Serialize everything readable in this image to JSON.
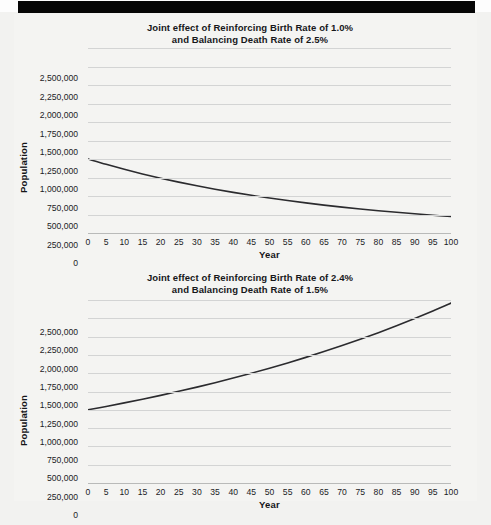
{
  "page": {
    "top_bar_color": "#060606",
    "paper_color": "#f2f2f0",
    "ink_color": "#1b1c1f",
    "grid_color": "#d3d4d4",
    "curve_color": "#2b2b2e"
  },
  "charts": [
    {
      "title_line1": "Joint effect of Reinforcing Birth Rate of 1.0%",
      "title_line2": "and Balancing Death Rate of 2.5%",
      "xlabel": "Year",
      "ylabel": "Population"
    },
    {
      "title_line1": "Joint effect of Reinforcing Birth Rate of 2.4%",
      "title_line2": "and Balancing Death Rate of 1.5%",
      "xlabel": "Year",
      "ylabel": "Population"
    }
  ],
  "chart_data": [
    {
      "type": "line",
      "title": "Joint effect of Reinforcing Birth Rate of 1.0% and Balancing Death Rate of 2.5%",
      "xlabel": "Year",
      "ylabel": "Population",
      "xlim": [
        0,
        100
      ],
      "ylim": [
        0,
        2500000
      ],
      "grid": true,
      "legend": "none",
      "birth_rate_percent": 1.0,
      "death_rate_percent": 2.5,
      "net_rate_percent": -1.5,
      "initial_population": 1000000,
      "xticks": [
        0,
        5,
        10,
        15,
        20,
        25,
        30,
        35,
        40,
        45,
        50,
        55,
        60,
        65,
        70,
        75,
        80,
        85,
        90,
        95,
        100
      ],
      "yticks": [
        0,
        250000,
        500000,
        750000,
        1000000,
        1250000,
        1500000,
        1750000,
        2000000,
        2250000,
        2500000
      ],
      "ytick_labels": [
        "0",
        "250,000",
        "500,000",
        "750,000",
        "1,000,000",
        "1,250,000",
        "1,500,000",
        "1,750,000",
        "2,000,000",
        "2,250,000",
        "2,500,000"
      ],
      "x": [
        0,
        5,
        10,
        15,
        20,
        25,
        30,
        35,
        40,
        45,
        50,
        55,
        60,
        65,
        70,
        75,
        80,
        85,
        90,
        95,
        100
      ],
      "y": [
        1000000,
        927743,
        860708,
        798516,
        740818,
        687289,
        637628,
        591555,
        548812,
        509156,
        472367,
        438235,
        406570,
        377193,
        349938,
        324652,
        301194,
        279432,
        259240,
        240508,
        223130
      ]
    },
    {
      "type": "line",
      "title": "Joint effect of Reinforcing Birth Rate of 2.4% and Balancing Death Rate of 1.5%",
      "xlabel": "Year",
      "ylabel": "Population",
      "xlim": [
        0,
        100
      ],
      "ylim": [
        0,
        2500000
      ],
      "grid": true,
      "legend": "none",
      "birth_rate_percent": 2.4,
      "death_rate_percent": 1.5,
      "net_rate_percent": 0.9,
      "initial_population": 1000000,
      "xticks": [
        0,
        5,
        10,
        15,
        20,
        25,
        30,
        35,
        40,
        45,
        50,
        55,
        60,
        65,
        70,
        75,
        80,
        85,
        90,
        95,
        100
      ],
      "yticks": [
        0,
        250000,
        500000,
        750000,
        1000000,
        1250000,
        1500000,
        1750000,
        2000000,
        2250000,
        2500000
      ],
      "ytick_labels": [
        "0",
        "250,000",
        "500,000",
        "750,000",
        "1,000,000",
        "1,250,000",
        "1,500,000",
        "1,750,000",
        "2,000,000",
        "2,250,000",
        "2,500,000"
      ],
      "x": [
        0,
        5,
        10,
        15,
        20,
        25,
        30,
        35,
        40,
        45,
        50,
        55,
        60,
        65,
        70,
        75,
        80,
        85,
        90,
        95,
        100
      ],
      "y": [
        1000000,
        1046028,
        1094174,
        1144540,
        1197217,
        1252323,
        1309964,
        1370262,
        1433329,
        1499302,
        1568312,
        1640495,
        1715999,
        1794968,
        1877561,
        1963939,
        2054270,
        2148728,
        2247495,
        2350764,
        2458731
      ]
    }
  ]
}
